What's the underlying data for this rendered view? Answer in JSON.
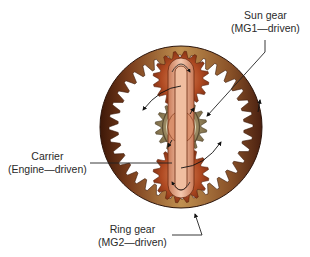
{
  "labels": {
    "sun_gear": {
      "line1": "Sun gear",
      "line2": "(MG1—driven)"
    },
    "carrier": {
      "line1": "Carrier",
      "line2": "(Engine—driven)"
    },
    "ring_gear": {
      "line1": "Ring gear",
      "line2": "(MG2—driven)"
    }
  },
  "colors": {
    "ring_dark": "#4a2010",
    "ring_light": "#b8864a",
    "planet": "#b5542a",
    "sun": "#8a7a55",
    "carrier": "#e0a585",
    "leader": "#222222"
  }
}
